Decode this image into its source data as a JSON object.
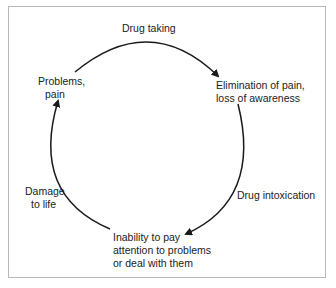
{
  "diagram": {
    "type": "cycle",
    "nodes": [
      {
        "id": "problems",
        "line1": "Problems,",
        "line2": "pain"
      },
      {
        "id": "elimination",
        "line1": "Elimination of pain,",
        "line2": "loss of awareness"
      },
      {
        "id": "inability",
        "line1": "Inability to pay",
        "line2": "attention to problems",
        "line3": "or deal with them"
      }
    ],
    "edges": [
      {
        "from": "problems",
        "to": "elimination",
        "label": "Drug taking"
      },
      {
        "from": "elimination",
        "to": "inability",
        "label": "Drug intoxication"
      },
      {
        "from": "inability",
        "to": "problems",
        "line1": "Damage",
        "line2": "to life"
      }
    ],
    "colors": {
      "stroke": "#1a1a1a",
      "border": "#b8b8b8",
      "text": "#222222"
    }
  }
}
